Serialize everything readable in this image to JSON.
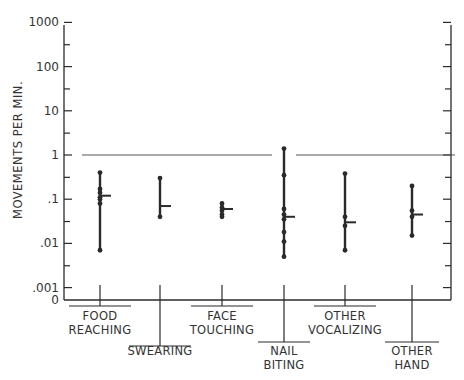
{
  "chart_data": {
    "type": "scatter",
    "title": "",
    "xlabel": "",
    "ylabel": "MOVEMENTS PER MIN.",
    "yscale": "log",
    "ylim": [
      0.001,
      1000
    ],
    "y_ticks": [
      "1000",
      "100",
      "10",
      "1",
      ".1",
      ".01",
      ".001",
      "0"
    ],
    "grid": false,
    "legend": null,
    "reference_line": {
      "y": 1,
      "style": "horizontal line"
    },
    "categories": [
      "FOOD REACHING",
      "SWEARING",
      "FACE TOUCHING",
      "NAIL BITING",
      "OTHER VOCALIZING",
      "OTHER HAND"
    ],
    "series": [
      {
        "name": "FOOD REACHING",
        "label_lines": [
          "FOOD",
          "REACHING"
        ],
        "points": [
          0.4,
          0.17,
          0.14,
          0.11,
          0.1,
          0.08,
          0.007
        ],
        "mean": 0.12,
        "min": 0.007,
        "max": 0.4
      },
      {
        "name": "SWEARING",
        "label_lines": [
          "SWEARING"
        ],
        "points": [
          0.3,
          0.04
        ],
        "mean": 0.07,
        "min": 0.04,
        "max": 0.3
      },
      {
        "name": "FACE TOUCHING",
        "label_lines": [
          "FACE",
          "TOUCHING"
        ],
        "points": [
          0.08,
          0.065,
          0.055,
          0.045,
          0.04
        ],
        "mean": 0.06,
        "min": 0.04,
        "max": 0.08
      },
      {
        "name": "NAIL BITING",
        "label_lines": [
          "NAIL",
          "BITING"
        ],
        "points": [
          1.4,
          0.35,
          0.06,
          0.045,
          0.035,
          0.018,
          0.011,
          0.005
        ],
        "mean": 0.04,
        "min": 0.005,
        "max": 1.4
      },
      {
        "name": "OTHER VOCALIZING",
        "label_lines": [
          "OTHER",
          "VOCALIZING"
        ],
        "points": [
          0.38,
          0.04,
          0.025,
          0.007
        ],
        "mean": 0.03,
        "min": 0.007,
        "max": 0.38
      },
      {
        "name": "OTHER HAND",
        "label_lines": [
          "OTHER",
          "HAND"
        ],
        "points": [
          0.2,
          0.055,
          0.04,
          0.015
        ],
        "mean": 0.045,
        "min": 0.015,
        "max": 0.2
      }
    ]
  },
  "axis": {
    "ylabel": "MOVEMENTS PER MIN.",
    "tick_labels": [
      "1000",
      "100",
      "10",
      "1",
      ".1",
      ".01",
      ".001",
      "0"
    ]
  },
  "colors": {
    "ink": "#2a2a2a",
    "background": "#ffffff"
  }
}
